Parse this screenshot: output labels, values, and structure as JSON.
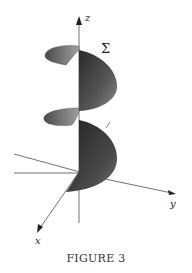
{
  "figure": {
    "caption": "FIGURE 3",
    "surface_label": "Σ",
    "axes": {
      "x": "x",
      "y": "y",
      "z": "z"
    },
    "colors": {
      "surface_dark": "#2e2e2e",
      "surface_mid": "#6a6a6a",
      "surface_light": "#9a9a9a",
      "axis": "#333333"
    }
  }
}
